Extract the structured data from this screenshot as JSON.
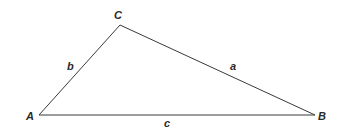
{
  "diagram": {
    "type": "triangle",
    "stroke_color": "#3a3a3a",
    "vertices": [
      {
        "name": "A",
        "x": 39,
        "y": 115
      },
      {
        "name": "C",
        "x": 120,
        "y": 25
      },
      {
        "name": "B",
        "x": 315,
        "y": 115
      }
    ],
    "vertex_labels": {
      "A": "A",
      "B": "B",
      "C": "C"
    },
    "side_labels": {
      "a": "a",
      "b": "b",
      "c": "c"
    }
  }
}
